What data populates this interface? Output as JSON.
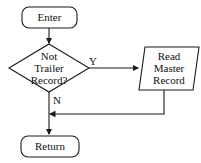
{
  "diagram": {
    "type": "flowchart",
    "nodes": {
      "enter": {
        "shape": "terminator",
        "label": "Enter"
      },
      "decision": {
        "shape": "diamond",
        "label_lines": [
          "Not",
          "Trailer",
          "Record?"
        ]
      },
      "read": {
        "shape": "parallelogram",
        "label_lines": [
          "Read",
          "Master",
          "Record"
        ]
      },
      "return": {
        "shape": "terminator",
        "label": "Return"
      }
    },
    "edges": {
      "yes_label": "Y",
      "no_label": "N"
    },
    "colors": {
      "stroke": "#1a1a1a",
      "background": "#ffffff"
    }
  }
}
